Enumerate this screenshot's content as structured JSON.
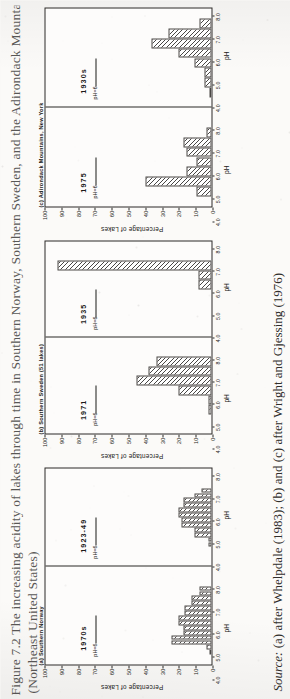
{
  "figure": {
    "caption_line1": "Figure 7.2  The increasing acidity of lakes through time in Southern Norway, Southern Sweden, and the Adirondack Mountains",
    "caption_line2": "(Northeast United States)",
    "source_prefix": "Source:",
    "source_text": "(a) after Whelpdale (1983); (b) and (c) after Wright and Gjessing (1976)"
  },
  "axes": {
    "ylabel": "Percentage of Lakes",
    "xlabel": "pH",
    "yticks": [
      0,
      10,
      20,
      30,
      40,
      50,
      60,
      70,
      80,
      90,
      100
    ],
    "ylim": [
      0,
      100
    ],
    "xticks": [
      "4.0",
      "5.0",
      "6.0",
      "7.0",
      "8.0"
    ],
    "xlim": [
      3.5,
      8.5
    ],
    "threshold_label": "pH=6",
    "threshold_value": 6.0
  },
  "chart_data": [
    {
      "type": "bar",
      "id": "panel-a",
      "title_line1": "(a) Southern Norway",
      "title_line2": "(187 lakes)",
      "title": "(a) Southern Norway (187 lakes)",
      "xlabel": "pH",
      "ylabel": "Percentage of Lakes",
      "ylim": [
        0,
        100
      ],
      "subplots": [
        {
          "year": "1970s",
          "categories": [
            "4.0-4.25",
            "4.25-4.5",
            "4.5-4.75",
            "4.75-5.0",
            "5.0-5.25",
            "5.25-5.5",
            "5.5-5.75",
            "5.75-6.0",
            "6.0-6.25",
            "6.25-6.5",
            "6.5-6.75",
            "6.75-7.0",
            "7.0-7.25",
            "7.25-7.5"
          ],
          "bin_centers": [
            4.125,
            4.375,
            4.625,
            4.875,
            5.125,
            5.375,
            5.625,
            5.875,
            6.125,
            6.375,
            6.625,
            6.875,
            7.125,
            7.375
          ],
          "values": [
            1,
            3,
            24,
            24,
            17,
            17,
            20,
            20,
            16,
            16,
            12,
            12,
            7,
            7
          ]
        },
        {
          "year": "1923-49",
          "categories": [
            "4.5-4.75",
            "4.75-5.0",
            "5.0-5.25",
            "5.25-5.5",
            "5.5-5.75",
            "5.75-6.0",
            "6.0-6.25",
            "6.25-6.5",
            "6.5-6.75",
            "6.75-7.0",
            "7.0-7.25",
            "7.25-7.5"
          ],
          "bin_centers": [
            4.625,
            4.875,
            5.125,
            5.375,
            5.625,
            5.875,
            6.125,
            6.375,
            6.625,
            6.875,
            7.125,
            7.375
          ],
          "values": [
            2,
            2,
            10,
            10,
            18,
            18,
            20,
            20,
            17,
            17,
            10,
            6
          ]
        }
      ]
    },
    {
      "type": "bar",
      "id": "panel-b",
      "title_line1": "(b) Southern Sweden (51 lakes)",
      "title_line2": "",
      "title": "(b) Southern Sweden (51 lakes)",
      "xlabel": "pH",
      "ylabel": "Percentage of Lakes",
      "ylim": [
        0,
        100
      ],
      "subplots": [
        {
          "year": "1971",
          "categories": [
            "4.5-5.0",
            "5.0-5.5",
            "5.5-6.0",
            "6.0-6.5",
            "6.5-7.0",
            "7.0-7.5"
          ],
          "bin_centers": [
            4.75,
            5.25,
            5.75,
            6.25,
            6.75,
            7.25
          ],
          "values": [
            2,
            2,
            20,
            45,
            38,
            33
          ]
        },
        {
          "year": "1935",
          "categories": [
            "5.5-6.0",
            "6.0-6.5",
            "6.5-7.0",
            "7.0-7.5"
          ],
          "bin_centers": [
            5.75,
            6.25,
            6.75,
            7.25
          ],
          "values": [
            0,
            8,
            8,
            93
          ]
        }
      ]
    },
    {
      "type": "bar",
      "id": "panel-c",
      "title_line1": "(c) Adirondack Mountains, New York",
      "title_line2": "(320 lakes)",
      "title_line1_alt": "(216 lakes)",
      "title": "(c) Adirondack Mountains, New York (320 lakes)",
      "xlabel": "pH",
      "ylabel": "Percentage of Lakes",
      "ylim": [
        0,
        100
      ],
      "subplots": [
        {
          "year": "1975",
          "subtitle": "(216 lakes)",
          "categories": [
            "4.0-4.5",
            "4.5-5.0",
            "5.0-5.5",
            "5.5-6.0",
            "6.0-6.5",
            "6.5-7.0",
            "7.0-7.5"
          ],
          "bin_centers": [
            4.25,
            4.75,
            5.25,
            5.75,
            6.25,
            6.75,
            7.25
          ],
          "values": [
            9,
            40,
            15,
            9,
            15,
            17,
            3
          ]
        },
        {
          "year": "1930s",
          "subtitle": "(320 lakes)",
          "categories": [
            "4.0-4.5",
            "4.5-5.0",
            "5.0-5.5",
            "5.5-6.0",
            "6.0-6.5",
            "6.5-7.0",
            "7.0-7.5",
            "7.5-8.0"
          ],
          "bin_centers": [
            4.25,
            4.75,
            5.25,
            5.75,
            6.25,
            6.75,
            7.25,
            7.75
          ],
          "values": [
            1,
            4,
            4,
            10,
            20,
            36,
            26,
            7
          ]
        }
      ]
    }
  ]
}
